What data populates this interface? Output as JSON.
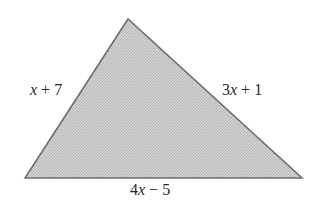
{
  "diagram": {
    "type": "triangle",
    "vertices": {
      "top": [
        128,
        19
      ],
      "bottom_left": [
        25,
        178
      ],
      "bottom_right": [
        302,
        178
      ]
    },
    "fill_color": "#c9c9c9",
    "stroke_color": "#6f6f6f",
    "sides": {
      "left": {
        "label": "x + 7",
        "coefficient": "",
        "variable": "x",
        "operator": " + ",
        "constant": "7"
      },
      "right": {
        "label": "3x + 1",
        "coefficient": "3",
        "variable": "x",
        "operator": " + ",
        "constant": "1"
      },
      "bottom": {
        "label": "4x − 5",
        "coefficient": "4",
        "variable": "x",
        "operator": " − ",
        "constant": "5"
      }
    }
  }
}
